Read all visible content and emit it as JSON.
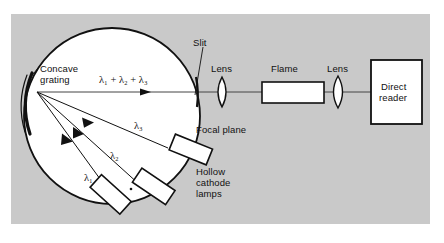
{
  "figure": {
    "background_panel_color": "#c9c9c9",
    "ink_color": "#111111",
    "component_fill": "#ffffff"
  },
  "labels": {
    "concave_grating_line1": "Concave",
    "concave_grating_line2": "grating",
    "wavelength_sum": "λ₁ + λ₂ + λ₃",
    "slit": "Slit",
    "lens_1": "Lens",
    "flame": "Flame",
    "lens_2": "Lens",
    "direct_reader_line1": "Direct",
    "direct_reader_line2": "reader",
    "focal_plane": "Focal plane",
    "hollow_cathode_line1": "Hollow",
    "hollow_cathode_line2": "cathode",
    "hollow_cathode_line3": "lamps",
    "lambda_1": "λ₁",
    "lambda_2": "λ₂",
    "lambda_3": "λ₃"
  },
  "components": [
    {
      "name": "rowland-circle",
      "kind": "circle"
    },
    {
      "name": "concave-grating",
      "kind": "arc"
    },
    {
      "name": "entrance-slit",
      "kind": "slit"
    },
    {
      "name": "lens-1",
      "kind": "lens"
    },
    {
      "name": "flame-cell",
      "kind": "rectangle"
    },
    {
      "name": "lens-2",
      "kind": "lens"
    },
    {
      "name": "direct-reader",
      "kind": "box"
    },
    {
      "name": "hollow-cathode-lamp-1",
      "kind": "tilted-rectangle"
    },
    {
      "name": "hollow-cathode-lamp-2",
      "kind": "tilted-rectangle"
    },
    {
      "name": "hollow-cathode-lamp-3",
      "kind": "tilted-rectangle"
    }
  ],
  "rays": [
    {
      "name": "combined-beam",
      "label": "λ₁ + λ₂ + λ₃",
      "direction": "grating-to-reader"
    },
    {
      "name": "ray-lambda-1",
      "label": "λ₁",
      "direction": "lamp-to-grating"
    },
    {
      "name": "ray-lambda-2",
      "label": "λ₂",
      "direction": "lamp-to-grating"
    },
    {
      "name": "ray-lambda-3",
      "label": "λ₃",
      "direction": "lamp-to-grating"
    }
  ]
}
